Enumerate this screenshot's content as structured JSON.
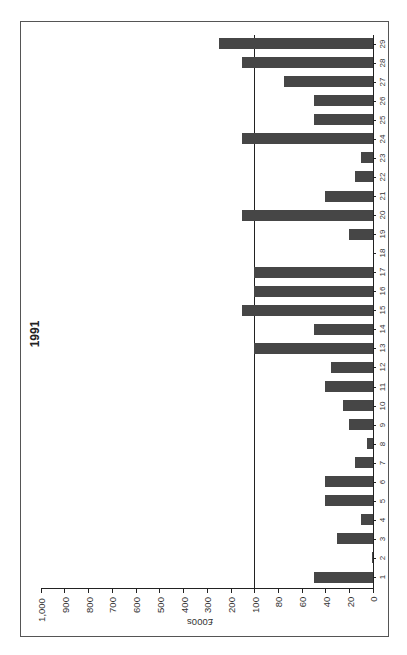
{
  "title": "1991",
  "chart_data": {
    "type": "bar",
    "orientation": "horizontal (figure rotated 90°, categories run bottom-to-top, values increase right-to-left)",
    "title": "1991",
    "xlabel": "",
    "ylabel": "£000s",
    "categories": [
      "1",
      "2",
      "3",
      "4",
      "5",
      "6",
      "7",
      "8",
      "9",
      "10",
      "11",
      "12",
      "13",
      "14",
      "15",
      "16",
      "17",
      "18",
      "19",
      "20",
      "21",
      "22",
      "23",
      "24",
      "25",
      "26",
      "27",
      "28",
      "29"
    ],
    "values": [
      50,
      1,
      30,
      10,
      40,
      40,
      15,
      5,
      20,
      25,
      40,
      35,
      100,
      50,
      150,
      100,
      100,
      0,
      20,
      150,
      40,
      15,
      10,
      150,
      50,
      50,
      75,
      150,
      250
    ],
    "axis_scale": "broken: 0–100 in steps of 20, then 100–1,000 in steps of 100",
    "value_ticks": [
      "0",
      "20",
      "40",
      "60",
      "80",
      "100",
      "200",
      "300",
      "400",
      "500",
      "600",
      "700",
      "800",
      "900",
      "1,000"
    ],
    "reference_line": 100,
    "ylim": [
      0,
      1000
    ],
    "grid": false,
    "legend": null,
    "bar_color": "#464646"
  },
  "axis": {
    "title": "£000s"
  }
}
